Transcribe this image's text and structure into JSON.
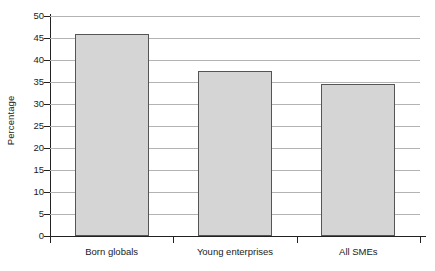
{
  "chart_data": {
    "type": "bar",
    "title": "",
    "subtitle": "",
    "xlabel": "",
    "ylabel": "Percentage",
    "categories": [
      "Born globals",
      "Young enterprises",
      "All SMEs"
    ],
    "values": [
      45.9,
      37.5,
      34.5
    ],
    "ylim": [
      0,
      50
    ],
    "ytick_labels": [
      "0",
      "5",
      "10",
      "15",
      "20",
      "25",
      "30",
      "35",
      "40",
      "45",
      "50"
    ],
    "ytick_values": [
      0,
      5,
      10,
      15,
      20,
      25,
      30,
      35,
      40,
      45,
      50
    ],
    "grid": "horizontal",
    "legend": "none",
    "annotations": [],
    "colors": {
      "bar_fill": "#d5d5d5",
      "bar_border": "#555555",
      "gridline": "#b3b3b3",
      "axis": "#222222",
      "text": "#1a1a1a",
      "background": "#ffffff"
    }
  }
}
